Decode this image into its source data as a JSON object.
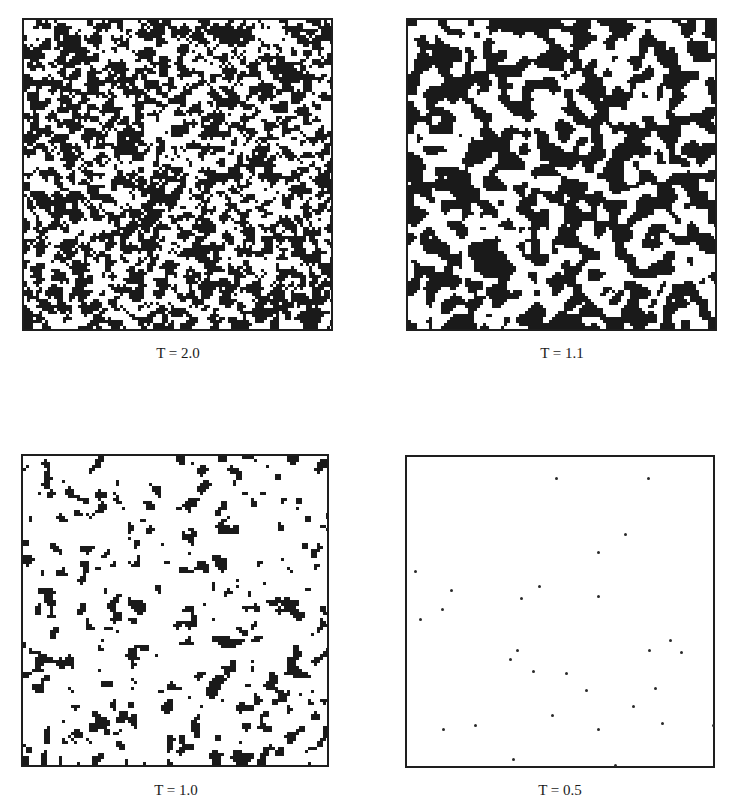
{
  "figure": {
    "panels": [
      {
        "id": "p1",
        "label": "T = 2.0",
        "temperature": 2.0,
        "density": 0.5,
        "cluster": 0.35
      },
      {
        "id": "p2",
        "label": "T = 1.1",
        "temperature": 1.1,
        "density": 0.5,
        "cluster": 0.75
      },
      {
        "id": "p3",
        "label": "T = 1.0",
        "temperature": 1.0,
        "density": 0.14,
        "cluster": 0.55
      },
      {
        "id": "p4",
        "label": "T = 0.5",
        "temperature": 0.5,
        "density": 0.0,
        "cluster": 0.0
      }
    ],
    "sparse_points_T05": [
      [
        556,
        478
      ],
      [
        648,
        478
      ],
      [
        625,
        534
      ],
      [
        598,
        552
      ],
      [
        415,
        571
      ],
      [
        451,
        590
      ],
      [
        539,
        586
      ],
      [
        521,
        598
      ],
      [
        598,
        596
      ],
      [
        442,
        609
      ],
      [
        420,
        619
      ],
      [
        670,
        640
      ],
      [
        649,
        650
      ],
      [
        681,
        652
      ],
      [
        517,
        650
      ],
      [
        510,
        659
      ],
      [
        533,
        671
      ],
      [
        566,
        673
      ],
      [
        586,
        690
      ],
      [
        655,
        688
      ],
      [
        633,
        706
      ],
      [
        552,
        715
      ],
      [
        443,
        729
      ],
      [
        475,
        725
      ],
      [
        598,
        729
      ],
      [
        662,
        723
      ],
      [
        713,
        725
      ],
      [
        513,
        759
      ],
      [
        615,
        765
      ]
    ],
    "colors": {
      "spin": "#1a1a1a",
      "background": "#ffffff",
      "frame": "#1e1e1e"
    }
  }
}
